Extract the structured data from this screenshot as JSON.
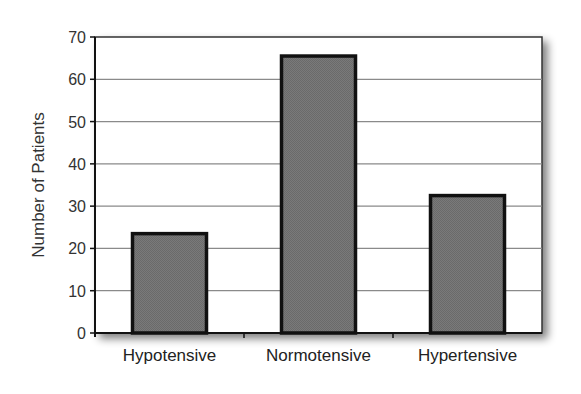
{
  "chart_data": {
    "type": "bar",
    "title": "",
    "xlabel": "",
    "ylabel": "Number of Patients",
    "categories": [
      "Hypotensive",
      "Normotensive",
      "Hypertensive"
    ],
    "values": [
      23.5,
      65.5,
      32.5
    ],
    "ylim": [
      0,
      70
    ],
    "yticks": [
      0,
      10,
      20,
      30,
      40,
      50,
      60,
      70
    ],
    "grid": true,
    "legend": null,
    "colors": {
      "bar_fill": "#777777",
      "bar_stroke": "#111111",
      "grid": "#8a8a8a",
      "plot_bg": "#ffffff",
      "shadow": "#9a9a9a"
    }
  }
}
